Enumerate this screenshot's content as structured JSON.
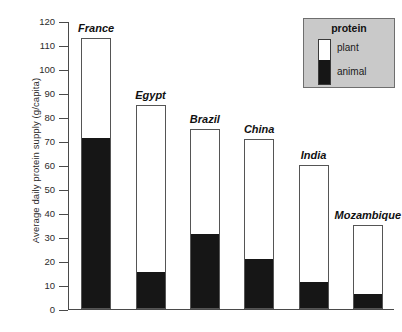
{
  "chart_data": {
    "type": "bar",
    "subtype": "stacked-vertical",
    "title": "",
    "xlabel": "",
    "ylabel": "Average daily protein supply (g/capita)",
    "ylim": [
      0,
      120
    ],
    "ytick_step": 10,
    "yticks": [
      120,
      110,
      100,
      90,
      80,
      70,
      60,
      50,
      40,
      30,
      20,
      10,
      0
    ],
    "grid": false,
    "categories": [
      "France",
      "Egypt",
      "Brazil",
      "China",
      "India",
      "Mozambique"
    ],
    "series": [
      {
        "name": "animal",
        "color": "#161616",
        "values": [
          71,
          15,
          31,
          20.5,
          11,
          6
        ]
      },
      {
        "name": "plant",
        "color": "#ffffff",
        "values": [
          42,
          70,
          44,
          50.5,
          49,
          29
        ]
      }
    ],
    "totals": [
      113,
      85,
      75,
      71,
      60,
      35
    ],
    "legend": {
      "title": "protein",
      "position": "top-right",
      "entries": [
        {
          "label": "plant",
          "color": "#ffffff"
        },
        {
          "label": "animal",
          "color": "#161616"
        }
      ]
    }
  },
  "axis": {
    "y_title": "Average daily protein supply (g/capita)",
    "ticks": [
      {
        "value": 120,
        "label": "120"
      },
      {
        "value": 110,
        "label": "110"
      },
      {
        "value": 100,
        "label": "100"
      },
      {
        "value": 90,
        "label": "90"
      },
      {
        "value": 80,
        "label": "80"
      },
      {
        "value": 70,
        "label": "70"
      },
      {
        "value": 60,
        "label": "60"
      },
      {
        "value": 50,
        "label": "50"
      },
      {
        "value": 40,
        "label": "40"
      },
      {
        "value": 30,
        "label": "30"
      },
      {
        "value": 20,
        "label": "20"
      },
      {
        "value": 10,
        "label": "10"
      },
      {
        "value": 0,
        "label": "0"
      }
    ]
  },
  "bars": [
    {
      "label": "France",
      "total": 113,
      "animal": 71
    },
    {
      "label": "Egypt",
      "total": 85,
      "animal": 15
    },
    {
      "label": "Brazil",
      "total": 75,
      "animal": 31
    },
    {
      "label": "China",
      "total": 71,
      "animal": 20.5
    },
    {
      "label": "India",
      "total": 60,
      "animal": 11
    },
    {
      "label": "Mozambique",
      "total": 35,
      "animal": 6
    }
  ],
  "legend": {
    "title": "protein",
    "plant_label": "plant",
    "animal_label": "animal"
  },
  "colors": {
    "animal": "#161616",
    "plant": "#ffffff",
    "axis": "#4a4a4a",
    "bar_outline": "#555555",
    "legend_background": "#c9c9c9"
  }
}
